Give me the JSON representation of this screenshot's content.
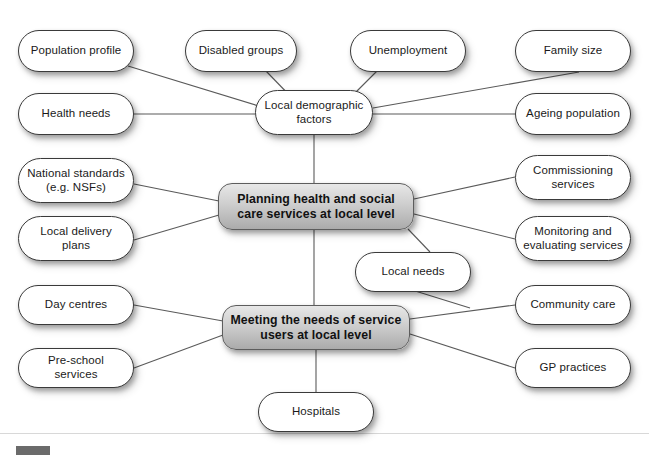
{
  "diagram": {
    "title": "Planning health and social care services at local level",
    "type": "concept-map",
    "cropped_header_text": "",
    "edge_color": "#5a5a5a",
    "node_fill": "#ffffff",
    "core_fill": "#cfcfcf",
    "text_color": "#1a1a1a",
    "marker_color": "#6b6b6b"
  },
  "nodes": {
    "population_profile": {
      "label": "Population profile",
      "x": 18,
      "y": 30,
      "w": 116,
      "h": 42
    },
    "disabled_groups": {
      "label": "Disabled groups",
      "x": 185,
      "y": 30,
      "w": 112,
      "h": 42
    },
    "unemployment": {
      "label": "Unemployment",
      "x": 350,
      "y": 30,
      "w": 116,
      "h": 42
    },
    "family_size": {
      "label": "Family size",
      "x": 515,
      "y": 30,
      "w": 116,
      "h": 42
    },
    "health_needs": {
      "label": "Health needs",
      "x": 18,
      "y": 93,
      "w": 116,
      "h": 42
    },
    "local_demographic_factors": {
      "label": "Local demographic factors",
      "x": 255,
      "y": 90,
      "w": 118,
      "h": 45
    },
    "ageing_population": {
      "label": "Ageing population",
      "x": 515,
      "y": 93,
      "w": 116,
      "h": 42
    },
    "national_standards": {
      "label": "National standards (e.g. NSFs)",
      "x": 18,
      "y": 158,
      "w": 116,
      "h": 45
    },
    "commissioning_services": {
      "label": "Commissioning services",
      "x": 515,
      "y": 155,
      "w": 116,
      "h": 45
    },
    "planning_core": {
      "label": "Planning health and social care services at local level",
      "x": 218,
      "y": 183,
      "w": 196,
      "h": 47
    },
    "local_delivery_plans": {
      "label": "Local delivery plans",
      "x": 18,
      "y": 216,
      "w": 116,
      "h": 45
    },
    "monitoring_services": {
      "label": "Monitoring and evaluating services",
      "x": 515,
      "y": 216,
      "w": 116,
      "h": 45
    },
    "local_needs": {
      "label": "Local needs",
      "x": 355,
      "y": 252,
      "w": 116,
      "h": 40
    },
    "day_centres": {
      "label": "Day centres",
      "x": 18,
      "y": 285,
      "w": 116,
      "h": 40
    },
    "community_care": {
      "label": "Community care",
      "x": 515,
      "y": 285,
      "w": 116,
      "h": 40
    },
    "meeting_core": {
      "label": "Meeting the needs of service users at local level",
      "x": 222,
      "y": 305,
      "w": 188,
      "h": 45
    },
    "pre_school_services": {
      "label": "Pre-school services",
      "x": 18,
      "y": 348,
      "w": 116,
      "h": 40
    },
    "gp_practices": {
      "label": "GP practices",
      "x": 515,
      "y": 348,
      "w": 116,
      "h": 40
    },
    "hospitals": {
      "label": "Hospitals",
      "x": 258,
      "y": 392,
      "w": 116,
      "h": 40
    }
  },
  "edges": [
    {
      "from": "population_profile",
      "to": "local_demographic_factors"
    },
    {
      "from": "disabled_groups",
      "to": "local_demographic_factors"
    },
    {
      "from": "unemployment",
      "to": "local_demographic_factors"
    },
    {
      "from": "family_size",
      "to": "local_demographic_factors"
    },
    {
      "from": "health_needs",
      "to": "local_demographic_factors"
    },
    {
      "from": "ageing_population",
      "to": "local_demographic_factors"
    },
    {
      "from": "local_demographic_factors",
      "to": "planning_core"
    },
    {
      "from": "national_standards",
      "to": "planning_core"
    },
    {
      "from": "local_delivery_plans",
      "to": "planning_core"
    },
    {
      "from": "commissioning_services",
      "to": "planning_core"
    },
    {
      "from": "monitoring_services",
      "to": "planning_core"
    },
    {
      "from": "local_needs",
      "to": "planning_core"
    },
    {
      "from": "local_needs",
      "to": "meeting_core"
    },
    {
      "from": "planning_core",
      "to": "meeting_core"
    },
    {
      "from": "day_centres",
      "to": "meeting_core"
    },
    {
      "from": "pre_school_services",
      "to": "meeting_core"
    },
    {
      "from": "community_care",
      "to": "meeting_core"
    },
    {
      "from": "gp_practices",
      "to": "meeting_core"
    },
    {
      "from": "hospitals",
      "to": "meeting_core"
    }
  ]
}
